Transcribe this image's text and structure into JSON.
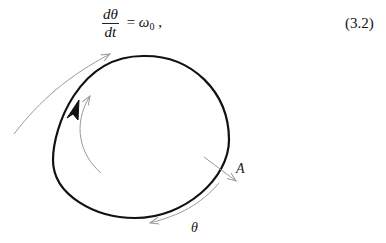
{
  "equation": {
    "numerator": "dθ",
    "denominator": "dt",
    "equals": " = ",
    "rhs_symbol": "ω",
    "rhs_subscript": "0",
    "trailing": " ,",
    "number": "(3.2)"
  },
  "figure": {
    "labels": {
      "amplitude": "A",
      "phase": "θ"
    },
    "colors": {
      "loop": "#111111",
      "arrows": "#9a9a9a"
    }
  }
}
